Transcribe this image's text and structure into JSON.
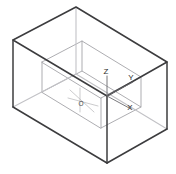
{
  "figure": {
    "background_color": "#ffffff",
    "outer_box": {
      "name": "outer-enclosure-box",
      "stroke_color": "#3a3a3c",
      "hidden_stroke_color": "#b9b9bd",
      "stroke_width": 1.5
    },
    "inner_box": {
      "name": "inner-region-box",
      "stroke_color": "#9a9a9e",
      "hidden_stroke_color": "#c9c9cd",
      "stroke_width": 1.0
    },
    "axes": {
      "name": "coordinate-axes",
      "stroke_color": "#5a5a5e",
      "origin_label": "O",
      "labels": [
        {
          "id": "z",
          "text": "Z",
          "x": 110,
          "y": 74
        },
        {
          "id": "y",
          "text": "Y",
          "x": 130,
          "y": 80
        },
        {
          "id": "x",
          "text": "X",
          "x": 129,
          "y": 108
        },
        {
          "id": "o",
          "text": "O",
          "x": 83,
          "y": 106
        }
      ]
    }
  },
  "geometry": {
    "outer": {
      "top_left": {
        "x": 13,
        "y": 40
      },
      "top_back": {
        "x": 76,
        "y": 7
      },
      "top_right": {
        "x": 167,
        "y": 62
      },
      "top_front": {
        "x": 107,
        "y": 96
      },
      "bot_left": {
        "x": 13,
        "y": 107
      },
      "bot_back": {
        "x": 76,
        "y": 74
      },
      "bot_right": {
        "x": 167,
        "y": 129
      },
      "bot_front": {
        "x": 107,
        "y": 163
      }
    },
    "inner": {
      "top_left": {
        "x": 42,
        "y": 62
      },
      "top_back": {
        "x": 82,
        "y": 41
      },
      "top_right": {
        "x": 141,
        "y": 77
      },
      "top_front": {
        "x": 101,
        "y": 98
      },
      "bot_left": {
        "x": 42,
        "y": 92
      },
      "bot_back": {
        "x": 82,
        "y": 71
      },
      "bot_right": {
        "x": 141,
        "y": 107
      },
      "bot_front": {
        "x": 101,
        "y": 128
      }
    },
    "origin": {
      "x": 107,
      "y": 96
    }
  }
}
